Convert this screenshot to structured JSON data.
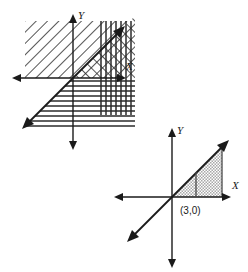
{
  "figure": {
    "background_color": "#ffffff",
    "stroke_color": "#1a1a1a",
    "graphs": [
      {
        "id": "top-graph",
        "name": "inequality-region-graph",
        "origin": {
          "x": 73,
          "y": 78
        },
        "axes": {
          "x_axis": {
            "label": "X",
            "label_x": 126,
            "label_y": 70,
            "x1": 14,
            "x2": 124,
            "y": 78,
            "arrow_start": true,
            "arrow_end": true
          },
          "y_axis": {
            "label": "Y",
            "label_x": 80,
            "label_y": 18,
            "y1": 14,
            "y2": 150,
            "x": 73,
            "arrow_start": true,
            "arrow_end": true
          }
        },
        "boundary_line": {
          "name": "y-equals-x-line",
          "slope": 1,
          "intercept": 0,
          "x1": 23,
          "y1": 128,
          "x2": 124,
          "y2": 27,
          "arrow_start": true,
          "arrow_end": true,
          "style": "solid"
        },
        "shaded_regions": [
          {
            "name": "diagonal-hatch-region",
            "pattern": "diagonal-nw-se",
            "x": 25,
            "y": 21,
            "width": 110,
            "height": 57,
            "clip": "above-x-axis"
          },
          {
            "name": "vertical-hatch-region",
            "pattern": "vertical-lines",
            "x": 97,
            "y": 21,
            "width": 38,
            "height": 94
          },
          {
            "name": "horizontal-hatch-region",
            "pattern": "horizontal-lines",
            "x": 23,
            "y": 78,
            "width": 112,
            "height": 37,
            "clip": "below-line-y-equals-x"
          },
          {
            "name": "diagonal-hatch-upper-right",
            "pattern": "diagonal-ne-sw",
            "x": 73,
            "y": 21,
            "width": 62,
            "height": 57,
            "clip": "above-line-y-equals-x"
          }
        ]
      },
      {
        "id": "bottom-graph",
        "name": "shaded-triangle-graph",
        "origin": {
          "x": 172,
          "y": 197
        },
        "axes": {
          "x_axis": {
            "label": "X",
            "label_x": 233,
            "label_y": 189,
            "x1": 114,
            "x2": 231,
            "y": 197,
            "arrow_start": true,
            "arrow_end": true
          },
          "y_axis": {
            "label": "Y",
            "label_x": 179,
            "label_y": 133,
            "y1": 128,
            "y2": 268,
            "x": 172,
            "arrow_start": true,
            "arrow_end": true
          }
        },
        "boundary_line": {
          "name": "y-equals-x-line",
          "slope": 1,
          "intercept": 0,
          "x1": 128,
          "y1": 241,
          "x2": 228,
          "y2": 141,
          "arrow_start": true,
          "arrow_end": true,
          "style": "solid"
        },
        "shaded_regions": [
          {
            "name": "stippled-triangle-region",
            "pattern": "stipple-gray",
            "vertices": [
              {
                "x": 172,
                "y": 197
              },
              {
                "x": 222,
                "y": 197
              },
              {
                "x": 222,
                "y": 147
              }
            ],
            "fill": "#c9c9c9"
          }
        ],
        "markers": [
          {
            "name": "x-intercept-tick",
            "type": "vertical-segment",
            "x": 196,
            "y1": 197,
            "y2": 172
          }
        ],
        "labels": [
          {
            "name": "point-label-3-0",
            "text": "(3,0)",
            "x": 180,
            "y": 214
          }
        ]
      }
    ]
  }
}
